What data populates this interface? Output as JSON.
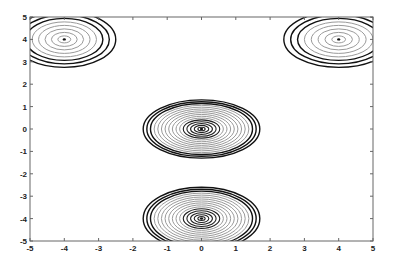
{
  "chart_data": {
    "type": "contour",
    "title": "",
    "xlabel": "",
    "ylabel": "",
    "xlim": [
      -5,
      5
    ],
    "ylim": [
      -5,
      5
    ],
    "grid": false,
    "x_ticks": [
      "-5",
      "-4",
      "-3",
      "-2",
      "-1",
      "0",
      "1",
      "2",
      "3",
      "4",
      "5"
    ],
    "y_ticks": [
      "5",
      "4",
      "3",
      "2",
      "1",
      "0",
      "-1",
      "-2",
      "-3",
      "-4",
      "-5"
    ],
    "peaks": [
      {
        "name": "top-left",
        "x": -4,
        "y": 4,
        "levels": 8,
        "rx": 1.5,
        "ry": 1.25
      },
      {
        "name": "top-right",
        "x": 4,
        "y": 4,
        "levels": 8,
        "rx": 1.6,
        "ry": 1.25
      },
      {
        "name": "center",
        "x": 0,
        "y": 0,
        "levels": 16,
        "rx": 1.7,
        "ry": 1.3
      },
      {
        "name": "bottom",
        "x": 0,
        "y": -4,
        "levels": 16,
        "rx": 1.7,
        "ry": 1.4
      }
    ],
    "line_colors": {
      "outer": "#111111",
      "mid": "#9a9a9a",
      "inner": "#222222"
    }
  }
}
